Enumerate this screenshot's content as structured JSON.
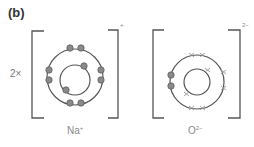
{
  "part_label": "(b)",
  "multiplier": "2×",
  "colors": {
    "shell": "#555555",
    "bracket": "#555555",
    "dot_fill": "#8a8a8a",
    "dot_stroke": "#555555",
    "cross": "#999999"
  },
  "ions": [
    {
      "symbol": "Na",
      "charge": "+",
      "bracket_charge": "+",
      "inner_shell_electrons": 2,
      "outer_shell_electrons": 8,
      "electron_marker": "dot"
    },
    {
      "symbol": "O",
      "charge": "2−",
      "bracket_charge": "2−",
      "inner_shell_electrons": 2,
      "outer_shell_electrons": 8,
      "electron_marker": "cross",
      "transferred_electrons": 2,
      "transferred_marker": "dot"
    }
  ]
}
